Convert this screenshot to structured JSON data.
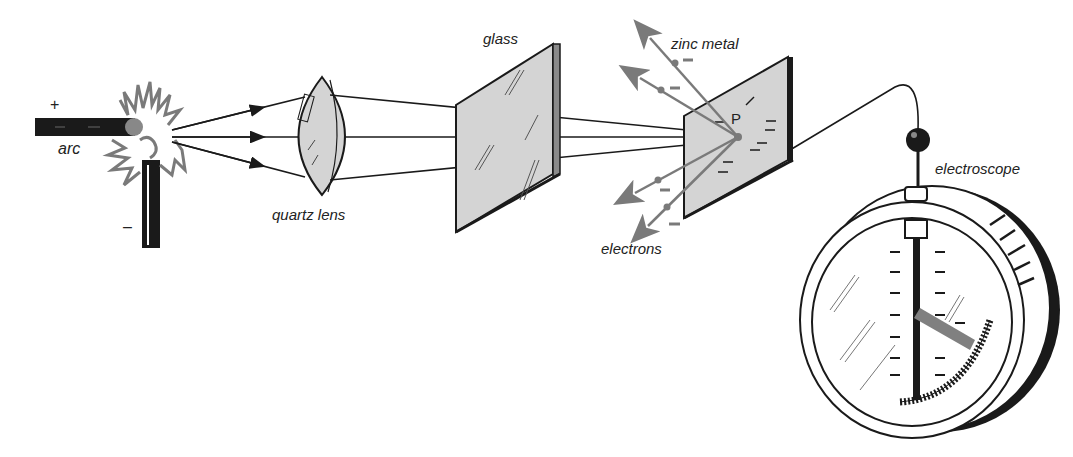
{
  "labels": {
    "arc": "arc",
    "plus": "+",
    "minus": "–",
    "quartz_lens": "quartz lens",
    "glass": "glass",
    "zinc_metal": "zinc metal",
    "point_p": "P",
    "electrons": "electrons",
    "electroscope": "electroscope"
  },
  "colors": {
    "ink": "#1a1a1a",
    "gray": "#7a7a7a",
    "fill": "#d4d4d4",
    "needle": "#808080"
  }
}
